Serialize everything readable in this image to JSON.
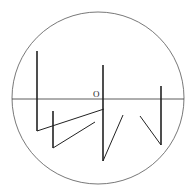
{
  "diagram": {
    "title": "",
    "origin_label": "O",
    "colors": {
      "stroke": "#222222",
      "circle": "#555555",
      "background": "#ffffff"
    },
    "circle": {
      "cx": 98,
      "cy": 98,
      "r": 86
    },
    "axis": {
      "x1": 12,
      "y1": 99,
      "x2": 184,
      "y2": 99
    },
    "vectors": [
      {
        "name": "stroke-1-vertical",
        "x1": 37,
        "y1": 51,
        "x2": 37,
        "y2": 131,
        "width": 1.6
      },
      {
        "name": "stroke-1-diagonal",
        "x1": 37,
        "y1": 131,
        "x2": 104,
        "y2": 109,
        "width": 1
      },
      {
        "name": "stroke-2-vertical",
        "x1": 53,
        "y1": 111,
        "x2": 53,
        "y2": 148,
        "width": 1.6
      },
      {
        "name": "stroke-2-diagonal",
        "x1": 53,
        "y1": 148,
        "x2": 95,
        "y2": 122,
        "width": 1
      },
      {
        "name": "stroke-3-vertical",
        "x1": 103,
        "y1": 65,
        "x2": 103,
        "y2": 161,
        "width": 1.6
      },
      {
        "name": "stroke-3-diagonal",
        "x1": 103,
        "y1": 161,
        "x2": 123,
        "y2": 115,
        "width": 1
      },
      {
        "name": "stroke-4-vertical",
        "x1": 161,
        "y1": 86,
        "x2": 161,
        "y2": 145,
        "width": 1.6
      },
      {
        "name": "stroke-4-diagonal",
        "x1": 161,
        "y1": 145,
        "x2": 140,
        "y2": 116,
        "width": 1
      }
    ]
  }
}
